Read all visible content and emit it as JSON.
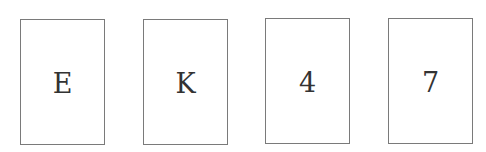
{
  "cards": [
    {
      "label": "E"
    },
    {
      "label": "K"
    },
    {
      "label": "4"
    },
    {
      "label": "7"
    }
  ],
  "colors": {
    "border": "#7a7a7a",
    "text": "#333333",
    "background": "#ffffff"
  }
}
